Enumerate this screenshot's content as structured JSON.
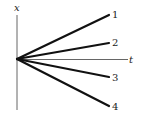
{
  "diagram": {
    "type": "position-time graph",
    "axes": {
      "vertical_label": "x",
      "horizontal_label": "t"
    },
    "lines": [
      {
        "label": "1",
        "direction": "up-steep"
      },
      {
        "label": "2",
        "direction": "up-shallow"
      },
      {
        "label": "3",
        "direction": "down-shallow"
      },
      {
        "label": "4",
        "direction": "down-steep"
      }
    ],
    "colors": {
      "line": "#111111",
      "axis": "#555555",
      "text": "#222222",
      "background": "#ffffff"
    }
  }
}
